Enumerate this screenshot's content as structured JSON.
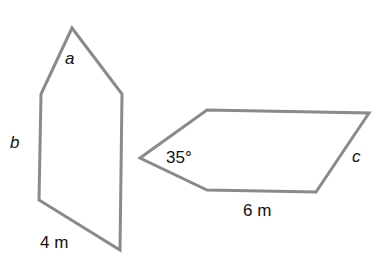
{
  "figure": {
    "stroke_color": "#8a8a8a",
    "shapes": [
      {
        "name": "pentagon-left",
        "points": "72,28 122,94 120,250 39,200 41,94",
        "labels": {
          "angle": "a",
          "side": "b",
          "base": "4 m"
        }
      },
      {
        "name": "pentagon-right",
        "points": "140,158 207,110 369,113 316,192 207,190",
        "labels": {
          "angle": "35°",
          "side": "c",
          "base": "6 m"
        }
      }
    ]
  }
}
